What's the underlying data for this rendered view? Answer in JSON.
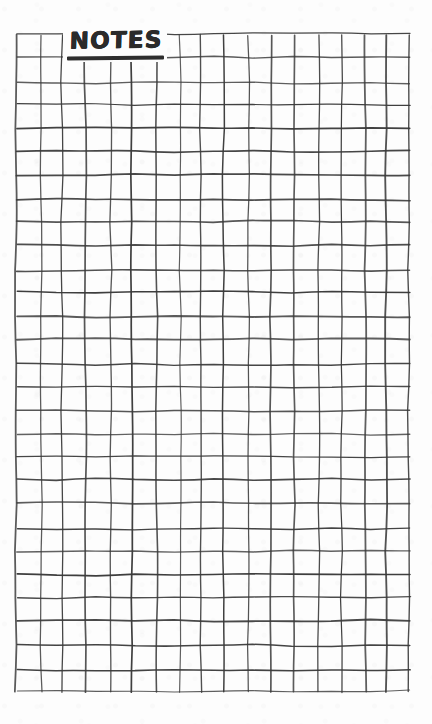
{
  "page": {
    "kind": "hand-drawn-grid-notes-page",
    "title": "NOTES",
    "background_color": "#fdfdfd",
    "ink_color": "#3a3a3a",
    "title_color": "#2b2b2b"
  },
  "title_block": {
    "label": "NOTES",
    "underline": true
  },
  "grid": {
    "columns": 17,
    "rows": 28,
    "left": 17,
    "top": 35,
    "right": 410,
    "bottom": 692,
    "cell_width": 23.1,
    "cell_height": 23.5,
    "line_color": "#3a3a3a",
    "line_width": 1.5,
    "style": "hand-drawn"
  },
  "margins": {
    "top": 35,
    "left": 17,
    "right": 22,
    "bottom": 32
  }
}
